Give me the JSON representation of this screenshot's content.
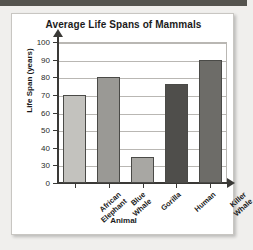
{
  "page": {
    "background_color": "#f0efed",
    "top_strip_color": "#55544f"
  },
  "card": {
    "background_color": "#ffffff",
    "border_color": "#c8c6c2"
  },
  "chart_data": {
    "type": "bar",
    "title": "Average Life Spans of Mammals",
    "xlabel": "Animal",
    "ylabel": "Life Span (years)",
    "categories": [
      "African Elephant",
      "Blue Whale",
      "Gorilla",
      "Human",
      "Killer Whale"
    ],
    "category_lines": [
      [
        "African",
        "Elephant"
      ],
      [
        "Blue",
        "Whale"
      ],
      [
        "Gorilla"
      ],
      [
        "Human"
      ],
      [
        "Killer",
        "Whale"
      ]
    ],
    "values": [
      70,
      80,
      35,
      76,
      90
    ],
    "bar_colors": [
      "#c3c2be",
      "#9a9995",
      "#a8a7a3",
      "#4f4e4b",
      "#6d6c68"
    ],
    "ylim": [
      0,
      105
    ],
    "yticks": [
      0,
      30,
      40,
      50,
      60,
      70,
      80,
      90,
      100
    ],
    "ytick_labels": [
      "0",
      "30",
      "40",
      "50",
      "60",
      "70",
      "80",
      "90",
      "100"
    ],
    "grid": true,
    "legend": false,
    "axis_note": "y-axis compressed between 0 and 30"
  }
}
